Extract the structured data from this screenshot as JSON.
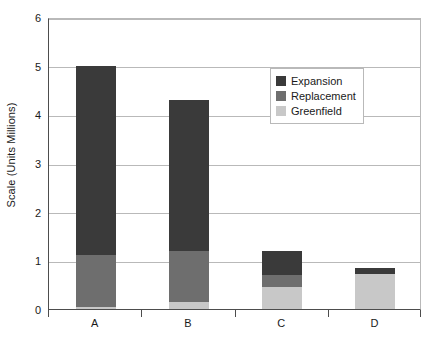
{
  "chart_data": {
    "type": "bar",
    "subtype": "stacked-bar",
    "title": "",
    "subtitle": "",
    "xlabel": "",
    "ylabel": "Scale (Units Millions)",
    "categories": [
      "A",
      "B",
      "C",
      "D"
    ],
    "series": [
      {
        "name": "Greenfield",
        "color": "#c8c8c8",
        "values": [
          0.05,
          0.15,
          0.45,
          0.72
        ]
      },
      {
        "name": "Replacement",
        "color": "#6e6e6e",
        "values": [
          1.05,
          1.05,
          0.25,
          0.0
        ]
      },
      {
        "name": "Expansion",
        "color": "#3a3a3a",
        "values": [
          3.9,
          3.1,
          0.5,
          0.13
        ]
      }
    ],
    "stack_order_bottom_to_top": [
      "Greenfield",
      "Replacement",
      "Expansion"
    ],
    "totals": [
      5.0,
      4.3,
      1.2,
      0.85
    ],
    "ylim": [
      0,
      6
    ],
    "yticks": [
      0,
      1,
      2,
      3,
      4,
      5,
      6
    ],
    "ytick_labels": [
      "0",
      "1",
      "2",
      "3",
      "4",
      "5",
      "6"
    ],
    "grid": true,
    "grid_axis": "y",
    "legend_position": "upper right inside",
    "legend_entries": [
      "Expansion",
      "Replacement",
      "Greenfield"
    ],
    "annotations": []
  },
  "legend": {
    "items": [
      {
        "label": "Expansion",
        "color": "#3a3a3a"
      },
      {
        "label": "Replacement",
        "color": "#6e6e6e"
      },
      {
        "label": "Greenfield",
        "color": "#c8c8c8"
      }
    ]
  },
  "axes": {
    "y_title": "Scale (Units Millions)"
  },
  "colors": {
    "axis": "#4d4d4d",
    "grid": "#b9b9b9",
    "frame": "#b9b9b9",
    "text": "#1a1a1a",
    "background": "#ffffff"
  }
}
